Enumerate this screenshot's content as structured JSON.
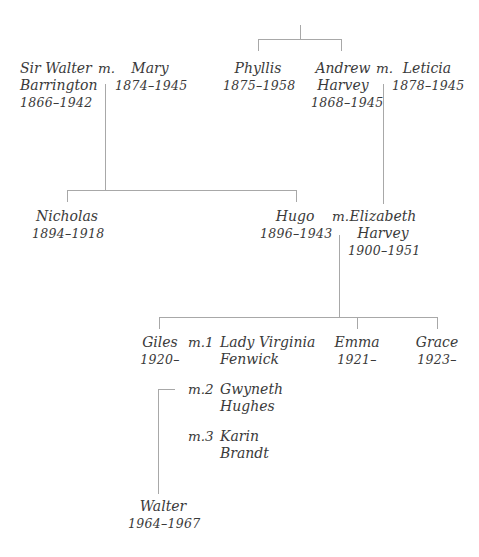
{
  "diagram": {
    "type": "family-tree",
    "marriage_marker": "m.",
    "people": {
      "walter_sr": {
        "name_line1": "Sir Walter",
        "name_line2": "Barrington",
        "dates": "1866–1942"
      },
      "mary": {
        "name_line1": "Mary",
        "dates": "1874–1945"
      },
      "phyllis": {
        "name_line1": "Phyllis",
        "dates": "1875–1958"
      },
      "andrew": {
        "name_line1": "Andrew",
        "name_line2": "Harvey",
        "dates": "1868–1945"
      },
      "leticia": {
        "name_line1": "Leticia",
        "dates": "1878–1945"
      },
      "nicholas": {
        "name_line1": "Nicholas",
        "dates": "1894–1918"
      },
      "hugo": {
        "name_line1": "Hugo",
        "dates": "1896–1943"
      },
      "elizabeth": {
        "name_line1": "Elizabeth",
        "name_line2": "Harvey",
        "dates": "1900–1951"
      },
      "giles": {
        "name_line1": "Giles",
        "dates": "1920–"
      },
      "virginia": {
        "name_line1": "Lady Virginia",
        "name_line2": "Fenwick"
      },
      "gwyneth": {
        "name_line1": "Gwyneth",
        "name_line2": "Hughes"
      },
      "karin": {
        "name_line1": "Karin",
        "name_line2": "Brandt"
      },
      "emma": {
        "name_line1": "Emma",
        "dates": "1921–"
      },
      "grace": {
        "name_line1": "Grace",
        "dates": "1923–"
      },
      "walter_jr": {
        "name_line1": "Walter",
        "dates": "1964–1967"
      }
    },
    "marriages": {
      "m_walter_mary": "m.",
      "m_andrew_leticia": "m.",
      "m_hugo_elizabeth": "m.",
      "m1_giles_virginia": "m.1",
      "m2_giles_gwyneth": "m.2",
      "m3_giles_karin": "m.3"
    },
    "line_color": "#a8a8a8",
    "text_color": "#3a3a3a"
  }
}
